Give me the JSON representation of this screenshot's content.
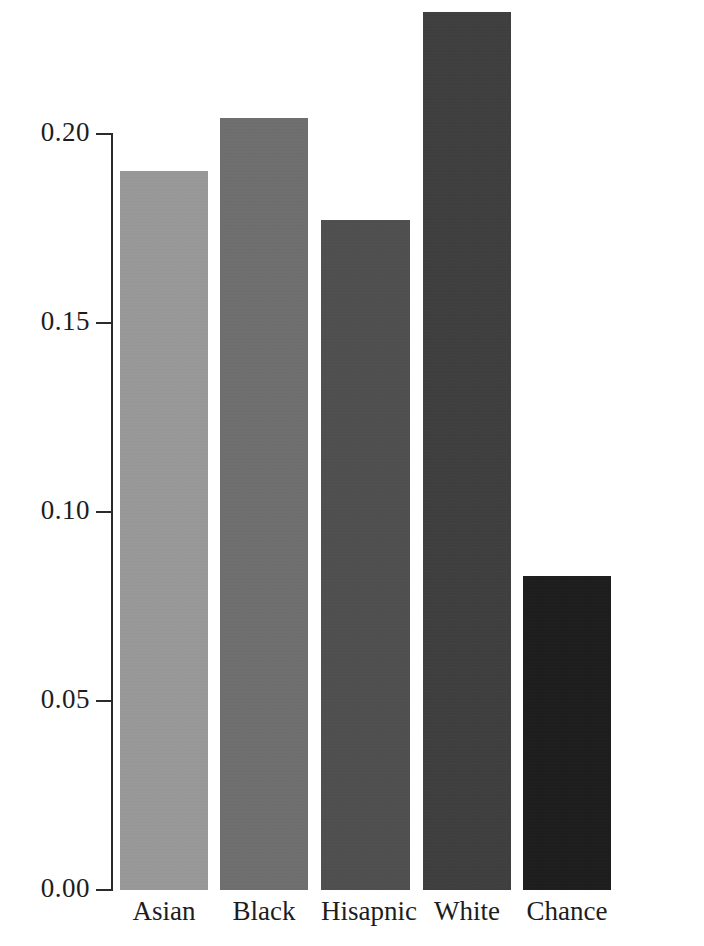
{
  "chart_data": {
    "type": "bar",
    "title": "",
    "subtitle": "",
    "xlabel": "",
    "ylabel": "",
    "categories": [
      "Asian",
      "Black",
      "Hisapnic",
      "White",
      "Chance"
    ],
    "values": [
      0.19,
      0.204,
      0.177,
      0.232,
      0.083
    ],
    "ylim": [
      0.0,
      0.2315
    ],
    "yticks": [
      0.0,
      0.05,
      0.1,
      0.15,
      0.2
    ],
    "ytick_labels": [
      "0.00",
      "0.05",
      "0.10",
      "0.15",
      "0.20"
    ],
    "xticks": [
      "Asian",
      "Black",
      "Hisapnic",
      "White",
      "Chance"
    ],
    "grid": false,
    "legend": null,
    "legend_position": "none",
    "annotations": [],
    "bar_colors": [
      "#9a9a9a",
      "#6d6d6d",
      "#4b4b4b",
      "#393939",
      "#151515"
    ],
    "axis_color": "#2b2b2b",
    "background_color": "#ffffff",
    "series": [
      {
        "name": "value",
        "values": [
          0.19,
          0.204,
          0.177,
          0.232,
          0.083
        ]
      }
    ]
  },
  "axis": {
    "tick_0": "0.00",
    "tick_1": "0.05",
    "tick_2": "0.10",
    "tick_3": "0.15",
    "tick_4": "0.20"
  },
  "bars": [
    {
      "label": "Asian",
      "value": "0.190",
      "color": "#9a9a9a"
    },
    {
      "label": "Black",
      "value": "0.204",
      "color": "#6d6d6d"
    },
    {
      "label": "Hisapnic",
      "value": "0.177",
      "color": "#4b4b4b"
    },
    {
      "label": "White",
      "value": "0.232",
      "color": "#393939"
    },
    {
      "label": "Chance",
      "value": "0.083",
      "color": "#151515"
    }
  ]
}
